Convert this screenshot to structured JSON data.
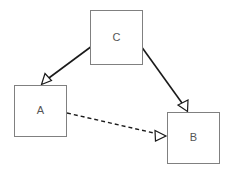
{
  "diagram": {
    "title": "",
    "background_color": "#ffffff",
    "node_border_color": "#808080",
    "node_fill_color": "#ffffff",
    "label_color": "#555555",
    "edge_color": "#1a1a1a",
    "arrowhead_style": "hollow-triangle",
    "nodes": [
      {
        "id": "C",
        "label": "C",
        "x": 90,
        "y": 10,
        "width": 52,
        "height": 54,
        "center_x": 116,
        "center_y": 37
      },
      {
        "id": "A",
        "label": "A",
        "x": 14,
        "y": 85,
        "width": 52,
        "height": 51,
        "center_x": 40,
        "center_y": 110
      },
      {
        "id": "B",
        "label": "B",
        "x": 167,
        "y": 112,
        "width": 52,
        "height": 51,
        "center_x": 193,
        "center_y": 137
      }
    ],
    "edges": [
      {
        "id": "c-to-a",
        "from": "C",
        "to": "A",
        "label": "",
        "style": "solid",
        "arrowhead": "hollow-triangle",
        "x1": 92,
        "y1": 46,
        "x2": 41,
        "y2": 84
      },
      {
        "id": "c-to-b",
        "from": "C",
        "to": "B",
        "label": "",
        "style": "solid",
        "arrowhead": "hollow-triangle",
        "x1": 141,
        "y1": 46,
        "x2": 187,
        "y2": 111
      },
      {
        "id": "a-to-b",
        "from": "A",
        "to": "B",
        "label": "",
        "style": "dashed",
        "arrowhead": "hollow-triangle",
        "x1": 67,
        "y1": 113,
        "x2": 166,
        "y2": 136
      }
    ]
  }
}
